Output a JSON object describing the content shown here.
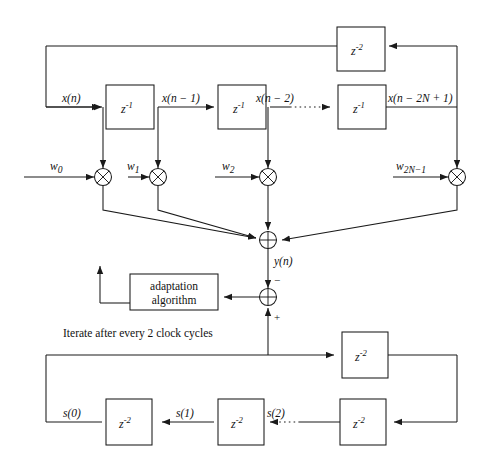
{
  "figure": {
    "caption": "Iterate after every 2 clock cycles",
    "stroke_color": "#1a1a1a",
    "background_color": "#ffffff"
  },
  "delay_line": {
    "blocks": [
      {
        "id": "fb-delay",
        "label_base": "z",
        "label_exp": "-2"
      },
      {
        "id": "d1",
        "label_base": "z",
        "label_exp": "-1"
      },
      {
        "id": "d2",
        "label_base": "z",
        "label_exp": "-1"
      },
      {
        "id": "d3",
        "label_base": "z",
        "label_exp": "-1"
      }
    ],
    "signals": [
      {
        "id": "x0",
        "label": "x(n)"
      },
      {
        "id": "x1",
        "label": "x(n − 1)"
      },
      {
        "id": "x2",
        "label": "x(n − 2)"
      },
      {
        "id": "xlast",
        "label": "x(n − 2N + 1)"
      }
    ],
    "ellipsis": "·····"
  },
  "weights": [
    {
      "id": "w0",
      "label": "w",
      "sub": "0"
    },
    {
      "id": "w1",
      "label": "w",
      "sub": "1"
    },
    {
      "id": "w2",
      "label": "w",
      "sub": "2"
    },
    {
      "id": "w2n1",
      "label": "w",
      "sub": "2N−1"
    }
  ],
  "nodes": {
    "multiplier_symbol": "⊗",
    "adder_symbol": "⊕",
    "output_label": "y(n)",
    "minus_sign": "−",
    "plus_sign": "+"
  },
  "adaptation": {
    "line1": "adaptation",
    "line2": "algorithm"
  },
  "feedback_line": {
    "blocks": [
      {
        "id": "s-in",
        "label_base": "z",
        "label_exp": "-2"
      },
      {
        "id": "s2blk",
        "label_base": "z",
        "label_exp": "-2"
      },
      {
        "id": "s1blk",
        "label_base": "z",
        "label_exp": "-2"
      },
      {
        "id": "s0blk",
        "label_base": "z",
        "label_exp": "-2"
      }
    ],
    "signals": [
      {
        "id": "s0",
        "label": "s(0)"
      },
      {
        "id": "s1",
        "label": "s(1)"
      },
      {
        "id": "s2",
        "label": "s(2)"
      }
    ],
    "ellipsis": "······"
  }
}
